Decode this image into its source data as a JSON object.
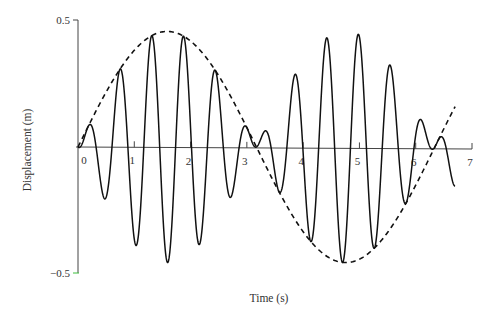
{
  "chart_data": {
    "type": "line",
    "title": "",
    "xlabel": "Time (s)",
    "ylabel": "Displacement (m)",
    "xlim": [
      0,
      7
    ],
    "ylim": [
      -0.5,
      0.5
    ],
    "x_ticks": [
      0,
      1,
      2,
      3,
      4,
      5,
      6,
      7
    ],
    "x_tick_labels": [
      "0",
      "1",
      "2",
      "3",
      "4",
      "5",
      "6",
      "7"
    ],
    "y_ticks": [
      0.5,
      -0.5
    ],
    "y_tick_labels": [
      "0.5",
      "−0.5"
    ],
    "grid": false,
    "legend": null,
    "series": [
      {
        "name": "displacement",
        "style": "solid",
        "color": "#111111",
        "model": "y = E(t) * cos(2*pi*(t - 0.18)/0.565)",
        "t_range": [
          0,
          6.7
        ],
        "peaks": [
          {
            "t": 0.18,
            "y": 0.08
          },
          {
            "t": 0.75,
            "y": 0.3
          },
          {
            "t": 1.31,
            "y": 0.43
          },
          {
            "t": 1.88,
            "y": 0.43
          },
          {
            "t": 2.44,
            "y": 0.29
          },
          {
            "t": 3.0,
            "y": 0.07
          },
          {
            "t": 3.37,
            "y": 0.07
          },
          {
            "t": 3.94,
            "y": 0.28
          },
          {
            "t": 4.5,
            "y": 0.42
          },
          {
            "t": 5.07,
            "y": 0.42
          },
          {
            "t": 5.63,
            "y": 0.27
          },
          {
            "t": 6.19,
            "y": 0.08
          },
          {
            "t": 6.56,
            "y": 0.08
          }
        ],
        "troughs": [
          {
            "t": 0.46,
            "y": -0.16
          },
          {
            "t": 1.03,
            "y": -0.38
          },
          {
            "t": 1.59,
            "y": -0.44
          },
          {
            "t": 2.16,
            "y": -0.39
          },
          {
            "t": 2.72,
            "y": -0.18
          },
          {
            "t": 3.66,
            "y": -0.18
          },
          {
            "t": 4.22,
            "y": -0.39
          },
          {
            "t": 4.78,
            "y": -0.47
          },
          {
            "t": 5.35,
            "y": -0.39
          },
          {
            "t": 5.91,
            "y": -0.18
          }
        ]
      },
      {
        "name": "envelope",
        "style": "dashed",
        "color": "#111111",
        "model": "E(t) = 0.455 * sin(pi * t / 3.17)",
        "t_range": [
          0,
          6.7
        ],
        "points": [
          {
            "t": 0.0,
            "y": 0.0
          },
          {
            "t": 1.6,
            "y": 0.445
          },
          {
            "t": 3.17,
            "y": 0.0
          },
          {
            "t": 4.75,
            "y": -0.47
          },
          {
            "t": 6.35,
            "y": 0.0
          },
          {
            "t": 6.7,
            "y": 0.32
          }
        ]
      }
    ],
    "annotations": []
  },
  "render": {
    "plot": {
      "x0": 78,
      "x7": 472,
      "y_zero": 147,
      "y_pos_half": 20,
      "y_neg_half": 273
    },
    "params": {
      "env_amp": 0.455,
      "env_half_period": 3.17,
      "osc_period": 0.565,
      "osc_phase_t": 0.18,
      "t_end": 6.7,
      "env_t_end": 6.7
    },
    "colors": {
      "axis": "#444444",
      "curve": "#111111",
      "neg_label": "#c03cbf",
      "neg_tick": "#3cc03c"
    }
  }
}
